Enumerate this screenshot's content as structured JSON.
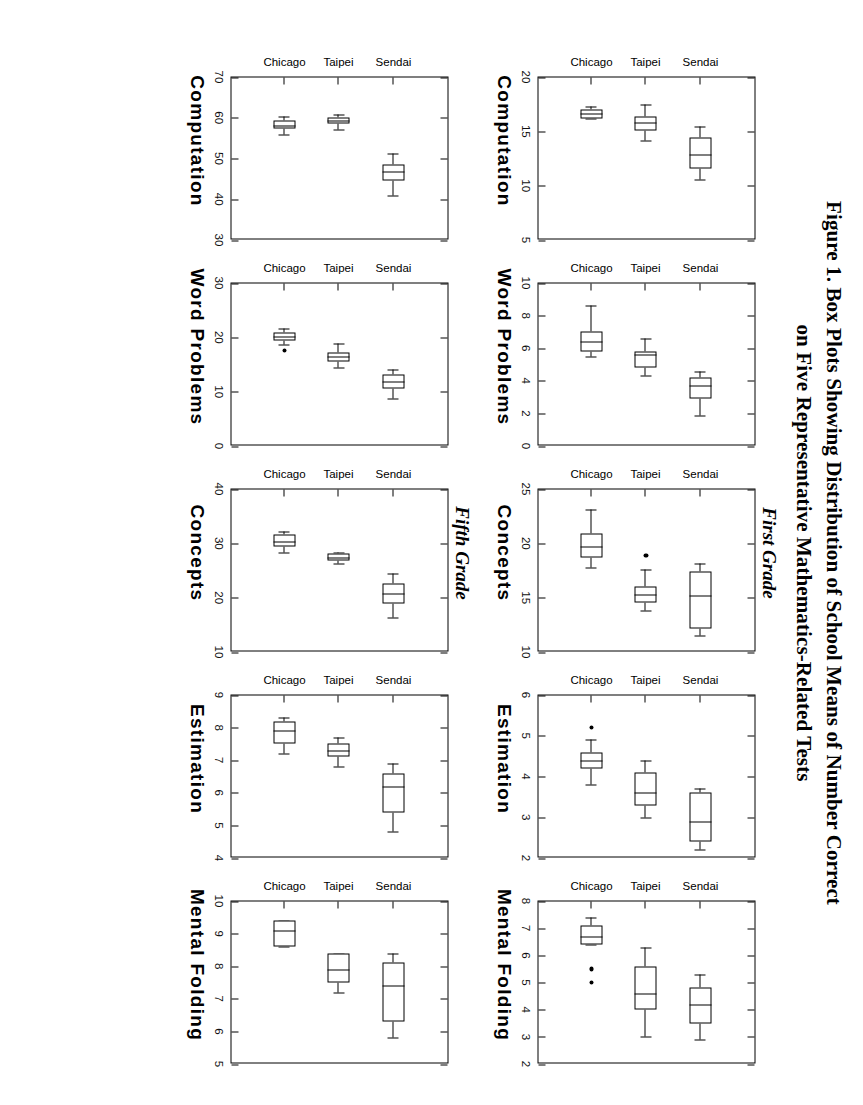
{
  "figure": {
    "title_line1": "Figure 1.  Box Plots Showing Distribution of School Means of Number Correct",
    "title_line2": "on Five Representative Mathematics-Related Tests",
    "grade_first": "First Grade",
    "grade_fifth": "Fifth Grade",
    "categories": [
      "Sendai",
      "Taipei",
      "Chicago"
    ]
  },
  "chart_data": [
    {
      "type": "box",
      "title": "Computation",
      "grade": "First Grade",
      "panel_index": 0,
      "categories": [
        "Sendai",
        "Taipei",
        "Chicago"
      ],
      "ylabel": "",
      "ylim": [
        5,
        20
      ],
      "yticks": [
        5,
        10,
        15,
        20
      ],
      "ytick_labels": [
        "5",
        "10",
        "15",
        "20"
      ],
      "grid": false,
      "boxes": [
        {
          "name": "Sendai",
          "whisker_low": 16.2,
          "q1": 16.2,
          "median": 16.6,
          "q3": 17.0,
          "whisker_high": 17.3,
          "outliers": []
        },
        {
          "name": "Taipei",
          "whisker_low": 14.2,
          "q1": 15.1,
          "median": 15.8,
          "q3": 16.4,
          "whisker_high": 17.5,
          "outliers": []
        },
        {
          "name": "Chicago",
          "whisker_low": 10.6,
          "q1": 11.6,
          "median": 12.9,
          "q3": 14.4,
          "whisker_high": 15.4,
          "outliers": []
        }
      ]
    },
    {
      "type": "box",
      "title": "Word Problems",
      "grade": "First Grade",
      "panel_index": 1,
      "categories": [
        "Sendai",
        "Taipei",
        "Chicago"
      ],
      "ylabel": "",
      "ylim": [
        0,
        10
      ],
      "yticks": [
        0,
        2,
        4,
        6,
        8,
        10
      ],
      "ytick_labels": [
        "0",
        "2",
        "4",
        "6",
        "8",
        "10"
      ],
      "grid": false,
      "boxes": [
        {
          "name": "Sendai",
          "whisker_low": 5.5,
          "q1": 5.8,
          "median": 6.4,
          "q3": 7.0,
          "whisker_high": 8.6,
          "outliers": []
        },
        {
          "name": "Taipei",
          "whisker_low": 4.3,
          "q1": 4.8,
          "median": 5.6,
          "q3": 5.8,
          "whisker_high": 6.6,
          "outliers": []
        },
        {
          "name": "Chicago",
          "whisker_low": 1.9,
          "q1": 2.9,
          "median": 3.7,
          "q3": 4.2,
          "whisker_high": 4.6,
          "outliers": []
        }
      ]
    },
    {
      "type": "box",
      "title": "Concepts",
      "grade": "First Grade",
      "panel_index": 2,
      "categories": [
        "Sendai",
        "Taipei",
        "Chicago"
      ],
      "ylabel": "",
      "ylim": [
        10,
        25
      ],
      "yticks": [
        10,
        15,
        20,
        25
      ],
      "ytick_labels": [
        "10",
        "15",
        "20",
        "25"
      ],
      "grid": false,
      "boxes": [
        {
          "name": "Sendai",
          "whisker_low": 17.8,
          "q1": 18.7,
          "median": 19.7,
          "q3": 20.9,
          "whisker_high": 23.1,
          "outliers": []
        },
        {
          "name": "Taipei",
          "whisker_low": 13.8,
          "q1": 14.6,
          "median": 15.3,
          "q3": 16.0,
          "whisker_high": 17.6,
          "outliers": [
            18.9
          ]
        },
        {
          "name": "Chicago",
          "whisker_low": 11.5,
          "q1": 12.2,
          "median": 15.2,
          "q3": 17.4,
          "whisker_high": 18.1,
          "outliers": []
        }
      ]
    },
    {
      "type": "box",
      "title": "Estimation",
      "grade": "First Grade",
      "panel_index": 3,
      "categories": [
        "Sendai",
        "Taipei",
        "Chicago"
      ],
      "ylabel": "",
      "ylim": [
        2,
        6
      ],
      "yticks": [
        2,
        3,
        4,
        5,
        6
      ],
      "ytick_labels": [
        "2",
        "3",
        "4",
        "5",
        "6"
      ],
      "grid": false,
      "boxes": [
        {
          "name": "Sendai",
          "whisker_low": 3.8,
          "q1": 4.2,
          "median": 4.4,
          "q3": 4.6,
          "whisker_high": 4.9,
          "outliers": [
            5.2
          ]
        },
        {
          "name": "Taipei",
          "whisker_low": 3.0,
          "q1": 3.3,
          "median": 3.6,
          "q3": 4.1,
          "whisker_high": 4.4,
          "outliers": []
        },
        {
          "name": "Chicago",
          "whisker_low": 2.2,
          "q1": 2.4,
          "median": 2.9,
          "q3": 3.6,
          "whisker_high": 3.7,
          "outliers": []
        }
      ]
    },
    {
      "type": "box",
      "title": "Mental Folding",
      "grade": "First Grade",
      "panel_index": 4,
      "categories": [
        "Sendai",
        "Taipei",
        "Chicago"
      ],
      "ylabel": "",
      "ylim": [
        2,
        8
      ],
      "yticks": [
        2,
        3,
        4,
        5,
        6,
        7,
        8
      ],
      "ytick_labels": [
        "2",
        "3",
        "4",
        "5",
        "6",
        "7",
        "8"
      ],
      "grid": false,
      "boxes": [
        {
          "name": "Sendai",
          "whisker_low": 6.4,
          "q1": 6.4,
          "median": 6.7,
          "q3": 7.1,
          "whisker_high": 7.4,
          "outliers": [
            5.5,
            5.0
          ]
        },
        {
          "name": "Taipei",
          "whisker_low": 3.0,
          "q1": 4.0,
          "median": 4.6,
          "q3": 5.6,
          "whisker_high": 6.3,
          "outliers": []
        },
        {
          "name": "Chicago",
          "whisker_low": 2.9,
          "q1": 3.5,
          "median": 4.2,
          "q3": 4.8,
          "whisker_high": 5.3,
          "outliers": []
        }
      ]
    },
    {
      "type": "box",
      "title": "Computation",
      "grade": "Fifth Grade",
      "panel_index": 5,
      "categories": [
        "Sendai",
        "Taipei",
        "Chicago"
      ],
      "ylabel": "",
      "ylim": [
        30,
        70
      ],
      "yticks": [
        30,
        40,
        50,
        60,
        70
      ],
      "ytick_labels": [
        "30",
        "40",
        "50",
        "60",
        "70"
      ],
      "grid": false,
      "boxes": [
        {
          "name": "Sendai",
          "whisker_low": 56.0,
          "q1": 57.3,
          "median": 58.2,
          "q3": 59.3,
          "whisker_high": 60.2,
          "outliers": []
        },
        {
          "name": "Taipei",
          "whisker_low": 57.2,
          "q1": 58.6,
          "median": 59.3,
          "q3": 60.1,
          "whisker_high": 60.8,
          "outliers": []
        },
        {
          "name": "Chicago",
          "whisker_low": 41.0,
          "q1": 44.6,
          "median": 46.7,
          "q3": 48.6,
          "whisker_high": 51.3,
          "outliers": []
        }
      ]
    },
    {
      "type": "box",
      "title": "Word Problems",
      "grade": "Fifth Grade",
      "panel_index": 6,
      "categories": [
        "Sendai",
        "Taipei",
        "Chicago"
      ],
      "ylabel": "",
      "ylim": [
        0,
        30
      ],
      "yticks": [
        0,
        10,
        20,
        30
      ],
      "ytick_labels": [
        "0",
        "10",
        "20",
        "30"
      ],
      "grid": false,
      "boxes": [
        {
          "name": "Sendai",
          "whisker_low": 18.6,
          "q1": 19.4,
          "median": 20.1,
          "q3": 20.9,
          "whisker_high": 21.6,
          "outliers": [
            17.6
          ]
        },
        {
          "name": "Taipei",
          "whisker_low": 14.4,
          "q1": 15.6,
          "median": 16.4,
          "q3": 17.2,
          "whisker_high": 18.8,
          "outliers": []
        },
        {
          "name": "Chicago",
          "whisker_low": 8.8,
          "q1": 10.5,
          "median": 11.9,
          "q3": 13.1,
          "whisker_high": 14.1,
          "outliers": []
        }
      ]
    },
    {
      "type": "box",
      "title": "Concepts",
      "grade": "Fifth Grade",
      "panel_index": 7,
      "categories": [
        "Sendai",
        "Taipei",
        "Chicago"
      ],
      "ylabel": "",
      "ylim": [
        10,
        40
      ],
      "yticks": [
        10,
        20,
        30,
        40
      ],
      "ytick_labels": [
        "10",
        "20",
        "30",
        "40"
      ],
      "grid": false,
      "boxes": [
        {
          "name": "Sendai",
          "whisker_low": 28.4,
          "q1": 29.4,
          "median": 30.3,
          "q3": 31.6,
          "whisker_high": 32.2,
          "outliers": []
        },
        {
          "name": "Taipei",
          "whisker_low": 26.2,
          "q1": 26.9,
          "median": 27.4,
          "q3": 28.2,
          "whisker_high": 28.4,
          "outliers": []
        },
        {
          "name": "Chicago",
          "whisker_low": 16.3,
          "q1": 18.9,
          "median": 20.7,
          "q3": 22.6,
          "whisker_high": 24.4,
          "outliers": []
        }
      ]
    },
    {
      "type": "box",
      "title": "Estimation",
      "grade": "Fifth Grade",
      "panel_index": 8,
      "categories": [
        "Sendai",
        "Taipei",
        "Chicago"
      ],
      "ylabel": "",
      "ylim": [
        4,
        9
      ],
      "yticks": [
        4,
        5,
        6,
        7,
        8,
        9
      ],
      "ytick_labels": [
        "4",
        "5",
        "6",
        "7",
        "8",
        "9"
      ],
      "grid": false,
      "boxes": [
        {
          "name": "Sendai",
          "whisker_low": 7.2,
          "q1": 7.5,
          "median": 7.9,
          "q3": 8.2,
          "whisker_high": 8.3,
          "outliers": []
        },
        {
          "name": "Taipei",
          "whisker_low": 6.8,
          "q1": 7.1,
          "median": 7.3,
          "q3": 7.5,
          "whisker_high": 7.7,
          "outliers": []
        },
        {
          "name": "Chicago",
          "whisker_low": 4.8,
          "q1": 5.4,
          "median": 6.2,
          "q3": 6.6,
          "whisker_high": 6.9,
          "outliers": []
        }
      ]
    },
    {
      "type": "box",
      "title": "Mental Folding",
      "grade": "Fifth Grade",
      "panel_index": 9,
      "categories": [
        "Sendai",
        "Taipei",
        "Chicago"
      ],
      "ylabel": "",
      "ylim": [
        5,
        10
      ],
      "yticks": [
        5,
        6,
        7,
        8,
        9,
        10
      ],
      "ytick_labels": [
        "5",
        "6",
        "7",
        "8",
        "9",
        "10"
      ],
      "grid": false,
      "boxes": [
        {
          "name": "Sendai",
          "whisker_low": 8.6,
          "q1": 8.6,
          "median": 9.1,
          "q3": 9.4,
          "whisker_high": 9.4,
          "outliers": []
        },
        {
          "name": "Taipei",
          "whisker_low": 7.2,
          "q1": 7.5,
          "median": 7.9,
          "q3": 8.4,
          "whisker_high": 8.4,
          "outliers": []
        },
        {
          "name": "Chicago",
          "whisker_low": 5.8,
          "q1": 6.3,
          "median": 7.4,
          "q3": 8.1,
          "whisker_high": 8.4,
          "outliers": []
        }
      ]
    }
  ]
}
